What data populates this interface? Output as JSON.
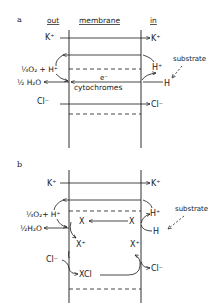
{
  "panel_a": {
    "label": "a",
    "headers": {
      "out": "out",
      "membrane": "membrane",
      "in": "in"
    },
    "k_left": "K⁺",
    "k_right": "K⁺",
    "o2": "¼O₂ + H⁺",
    "h2o": "½ H₂O",
    "electron": "e⁻",
    "cytochromes": "cytochromes",
    "h_in": "H⁺",
    "h_substrate": "H",
    "substrate": "substrate",
    "cl_left": "Cl⁻",
    "cl_right": "Cl⁻"
  },
  "panel_b": {
    "label": "b",
    "k_left": "K⁺",
    "k_right": "K⁺",
    "o2": "¼O₂+ H⁺",
    "h2o": "½H₂O",
    "x_left": "X",
    "x_right": "X",
    "xplus_left": "X⁺",
    "xplus_right": "X⁺",
    "h_in": "H⁺",
    "h_substrate": "H",
    "substrate": "substrate",
    "cl_left": "Cl⁻",
    "xcl": "XCl",
    "cl_right": "Cl⁻"
  }
}
